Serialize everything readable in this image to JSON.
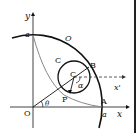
{
  "diagram": {
    "type": "geometry",
    "labels": {
      "y_axis": "y",
      "x_axis": "x",
      "x_prime": "x'",
      "origin": "O",
      "a_on_y": "a",
      "a_on_x": "a",
      "big_circle": "O",
      "small_circle": "C",
      "center": "C",
      "point_B": "B",
      "point_A": "A",
      "point_P": "P",
      "theta": "θ",
      "alpha": "α"
    },
    "colors": {
      "line": "#111111",
      "curve": "#888888",
      "dashed": "#333333"
    }
  }
}
